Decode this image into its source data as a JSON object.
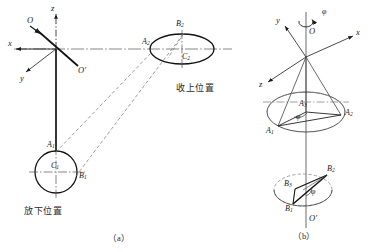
{
  "figure": {
    "caption_a": "（a）",
    "caption_b": "（b）",
    "labels_cjk": {
      "raised": "收上位置",
      "lowered": "放下位置"
    }
  },
  "diagram_a": {
    "axes": [
      {
        "name": "x-axis",
        "label": "x"
      },
      {
        "name": "y-axis",
        "label": "y"
      },
      {
        "name": "z-axis",
        "label": "z"
      }
    ],
    "origins": [
      {
        "name": "origin-O",
        "label": "O"
      },
      {
        "name": "origin-O-prime",
        "label": "O′"
      }
    ],
    "points": [
      {
        "name": "point-A1",
        "base": "A",
        "sub": "1"
      },
      {
        "name": "point-B1",
        "base": "B",
        "sub": "1"
      },
      {
        "name": "point-C1",
        "base": "C",
        "sub": "1"
      },
      {
        "name": "point-A2",
        "base": "A",
        "sub": "2"
      },
      {
        "name": "point-B2",
        "base": "B",
        "sub": "2"
      },
      {
        "name": "point-C2",
        "base": "C",
        "sub": "2"
      }
    ],
    "shapes": [
      {
        "name": "circle-C1-lowered",
        "type": "circle"
      },
      {
        "name": "ellipse-C2-raised",
        "type": "ellipse"
      }
    ]
  },
  "diagram_b": {
    "axes": [
      {
        "name": "x-axis",
        "label": "x"
      },
      {
        "name": "y-axis",
        "label": "y"
      },
      {
        "name": "z-axis",
        "label": "z"
      }
    ],
    "origins": [
      {
        "name": "origin-O",
        "label": "O"
      },
      {
        "name": "origin-O-prime",
        "label": "O′"
      }
    ],
    "rotation": {
      "name": "rotation-angle-phi",
      "label": "φ"
    },
    "angle_upper": {
      "name": "angle-phi-upper",
      "label": "φ"
    },
    "angle_lower": {
      "name": "angle-phi-lower",
      "label": "φ"
    },
    "points": [
      {
        "name": "point-A1",
        "base": "A",
        "sub": "1"
      },
      {
        "name": "point-A2",
        "base": "A",
        "sub": "2"
      },
      {
        "name": "point-A3",
        "base": "A",
        "sub": "3"
      },
      {
        "name": "point-B1",
        "base": "B",
        "sub": "1"
      },
      {
        "name": "point-B2",
        "base": "B",
        "sub": "2"
      },
      {
        "name": "point-B3",
        "base": "B",
        "sub": "3"
      }
    ],
    "shapes": [
      {
        "name": "ellipse-upper-A",
        "type": "ellipse"
      },
      {
        "name": "ellipse-lower-B",
        "type": "ellipse"
      },
      {
        "name": "cone-sweep",
        "type": "cone"
      }
    ]
  },
  "style": {
    "stroke": "#1a1a1a",
    "stroke_light": "#6e6e6e",
    "background": "#ffffff"
  }
}
